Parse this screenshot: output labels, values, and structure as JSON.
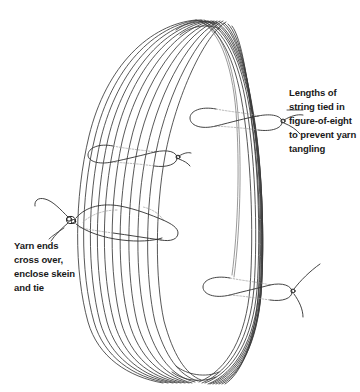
{
  "figure": {
    "background_color": "#ffffff",
    "line_color": "#3a3a3a",
    "text_color": "#191919"
  },
  "annotations": [
    {
      "id": "string-ties",
      "position": "right",
      "lines": [
        "Lengths of",
        "string tied in",
        "figure-of-eight",
        "to prevent yarn",
        "tangling"
      ]
    },
    {
      "id": "yarn-ends",
      "position": "left",
      "lines": [
        "Yarn ends",
        "cross over,",
        "enclose skein",
        "and tie"
      ]
    }
  ],
  "skein": {
    "strand_count": 11,
    "description": "large ring of parallel yarn strands viewed at an angle"
  },
  "ties": [
    {
      "id": "tie-upper-right",
      "type": "figure-of-eight",
      "knot_side": "right"
    },
    {
      "id": "tie-middle-left",
      "type": "figure-of-eight",
      "knot_side": "right"
    },
    {
      "id": "tie-yarn-ends",
      "type": "crossed-yarn-ends",
      "knot_side": "left"
    },
    {
      "id": "tie-lower-right",
      "type": "figure-of-eight",
      "knot_side": "right"
    }
  ]
}
